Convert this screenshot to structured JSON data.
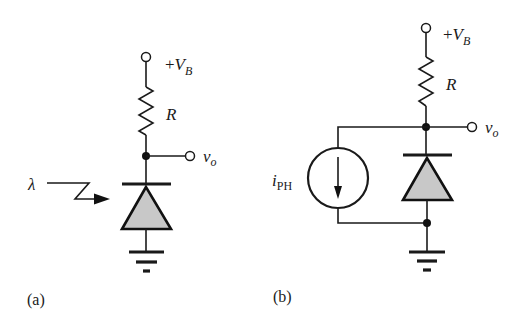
{
  "figure": {
    "panels": [
      {
        "id": "a",
        "caption": "(a)",
        "supply_label_prefix": "+",
        "supply_label_var": "V",
        "supply_label_sub": "B",
        "resistor_label": "R",
        "output_label_var": "v",
        "output_label_sub": "o",
        "light_label": "λ",
        "components": [
          "supply-terminal",
          "resistor",
          "output-node",
          "photodiode",
          "light-arrow",
          "ground"
        ]
      },
      {
        "id": "b",
        "caption": "(b)",
        "supply_label_prefix": "+",
        "supply_label_var": "V",
        "supply_label_sub": "B",
        "resistor_label": "R",
        "output_label_var": "v",
        "output_label_sub": "o",
        "source_label_var": "i",
        "source_label_sub": "PH",
        "components": [
          "supply-terminal",
          "resistor",
          "output-node",
          "diode",
          "current-source",
          "ground"
        ]
      }
    ],
    "colors": {
      "line": "#1a1a1a",
      "diode_fill": "#c8c8c8",
      "background": "#ffffff"
    }
  }
}
